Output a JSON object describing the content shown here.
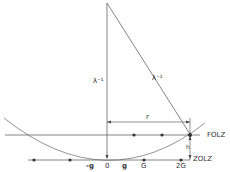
{
  "diagram": {
    "type": "ewald-sphere-construction",
    "labels": {
      "radius_vertical": "λ⁻¹",
      "radius_sloped": "λ⁻¹",
      "r": "r",
      "folz": "FOLZ",
      "zolz": "ZOLZ",
      "h": "h",
      "neg_g": "-g",
      "origin": "0",
      "g": "g",
      "G": "G",
      "two_G": "2G"
    },
    "colors": {
      "line": "#555555",
      "dot": "#333333"
    }
  }
}
